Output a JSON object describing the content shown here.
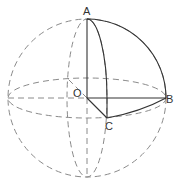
{
  "diagram": {
    "type": "sphere-geometry",
    "points": {
      "A": {
        "label": "A",
        "x": 87,
        "y": 19
      },
      "B": {
        "label": "B",
        "x": 165,
        "y": 98
      },
      "C": {
        "label": "C",
        "x": 107,
        "y": 118
      },
      "O": {
        "label": "O",
        "x": 87,
        "y": 98
      }
    },
    "sphere": {
      "cx": 87,
      "cy": 98,
      "r": 79
    },
    "equator": {
      "rx": 79,
      "ry": 20
    },
    "meridian": {
      "rx": 20,
      "ry": 79
    },
    "colors": {
      "solid": "#333333",
      "dashed": "#8a8a8a",
      "background": "#ffffff"
    }
  }
}
